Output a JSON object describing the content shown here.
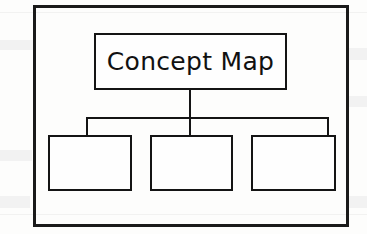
{
  "diagram": {
    "title": "Concept Map",
    "root": {
      "label": "Concept Map"
    },
    "children": [
      {
        "label": ""
      },
      {
        "label": ""
      },
      {
        "label": ""
      }
    ],
    "colors": {
      "ink": "#141414",
      "frame": "#1a1a1a",
      "paper": "#fdfdfc",
      "node_fill": "#fefefe"
    }
  }
}
